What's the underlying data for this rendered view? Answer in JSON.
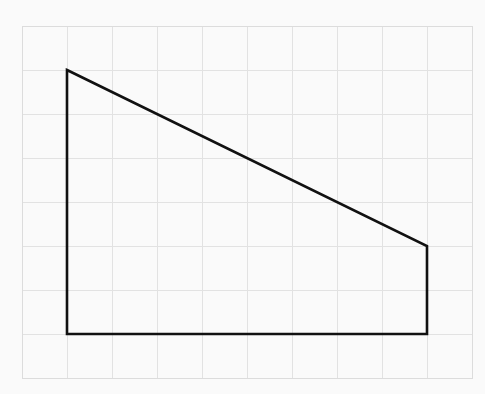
{
  "figure": {
    "canvas": {
      "width": 485,
      "height": 394,
      "background_color": "#fafafa"
    },
    "grid": {
      "origin_x": 22,
      "origin_y": 26,
      "cell_width": 45,
      "cell_height": 44,
      "columns": 10,
      "rows": 8,
      "line_color": "#e2e2e2",
      "border_color": "#dcdcdc",
      "line_width": 1,
      "visible": true
    },
    "shape": {
      "name": "right-trapezoid",
      "type": "polygon",
      "stroke_color": "#111111",
      "stroke_width": 2.6,
      "fill": "none",
      "closed": true,
      "vertices_grid_units": [
        {
          "label": "top-left",
          "col": 1,
          "row": 1
        },
        {
          "label": "top-right",
          "col": 9,
          "row": 5
        },
        {
          "label": "bottom-right",
          "col": 9,
          "row": 7
        },
        {
          "label": "bottom-left",
          "col": 1,
          "row": 7
        }
      ],
      "vertices_pixels": [
        {
          "label": "top-left",
          "x": 67,
          "y": 70
        },
        {
          "label": "top-right",
          "x": 427,
          "y": 246
        },
        {
          "label": "bottom-right",
          "x": 427,
          "y": 334
        },
        {
          "label": "bottom-left",
          "x": 67,
          "y": 334
        }
      ],
      "edges": [
        {
          "label": "slanted-top-edge",
          "from": "top-left",
          "to": "top-right"
        },
        {
          "label": "right-edge",
          "from": "top-right",
          "to": "bottom-right"
        },
        {
          "label": "bottom-edge",
          "from": "bottom-right",
          "to": "bottom-left"
        },
        {
          "label": "left-edge",
          "from": "bottom-left",
          "to": "top-left"
        }
      ],
      "measurements_in_cells": {
        "bottom_edge_length": 8,
        "left_edge_height": 6,
        "right_edge_height": 2
      }
    }
  },
  "chart_data": {
    "type": "scatter",
    "xlabel": "",
    "ylabel": "",
    "xlim": [
      0,
      10
    ],
    "ylim": [
      0,
      8
    ],
    "grid": true,
    "legend": "none",
    "series": [
      {
        "name": "right-trapezoid",
        "x": [
          1,
          9,
          9,
          1,
          1
        ],
        "y": [
          7,
          3,
          1,
          1,
          7
        ]
      }
    ],
    "annotations": []
  }
}
